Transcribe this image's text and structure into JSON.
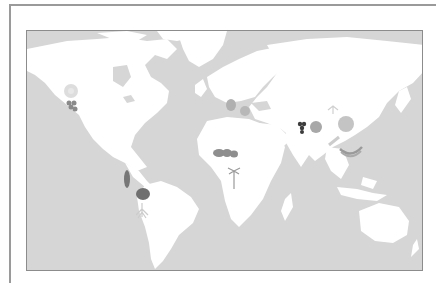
{
  "map": {
    "title": "",
    "ocean_color": "#d6d6d6",
    "land_color": "#ffffff",
    "frame_color": "#8c8c8c"
  },
  "markers": [
    {
      "name": "citrus-flower",
      "region": "North America (west)",
      "icon": "flower-icon",
      "color": "#d8d8d8"
    },
    {
      "name": "grapes-north-america",
      "region": "North America (west)",
      "icon": "grapes-icon",
      "color": "#8a8a8a"
    },
    {
      "name": "pepper",
      "region": "South America (Andes)",
      "icon": "pepper-icon",
      "color": "#777777"
    },
    {
      "name": "tomato",
      "region": "South America (Brazil)",
      "icon": "tomato-icon",
      "color": "#6f6f6f"
    },
    {
      "name": "plant-roots",
      "region": "South America (south)",
      "icon": "plant-icon",
      "color": "#cfcfcf"
    },
    {
      "name": "olive-pear",
      "region": "Mediterranean",
      "icon": "pear-icon",
      "color": "#b0b0b0"
    },
    {
      "name": "fig",
      "region": "Mediterranean (east)",
      "icon": "fig-icon",
      "color": "#b8b8b8"
    },
    {
      "name": "coffee-beans",
      "region": "West Africa",
      "icon": "beans-icon",
      "color": "#8e8e8e"
    },
    {
      "name": "date-palm",
      "region": "Central Africa",
      "icon": "palm-icon",
      "color": "#9a9a9a"
    },
    {
      "name": "grapes-asia",
      "region": "Central Asia",
      "icon": "grapes-icon",
      "color": "#3c3c3c"
    },
    {
      "name": "apple",
      "region": "Central Asia",
      "icon": "apple-icon",
      "color": "#a8a8a8"
    },
    {
      "name": "orange",
      "region": "China",
      "icon": "orange-icon",
      "color": "#c4c4c4"
    },
    {
      "name": "tea-leaves",
      "region": "China (west)",
      "icon": "leaf-icon",
      "color": "#d4d4d4"
    },
    {
      "name": "sugarcane",
      "region": "Southeast Asia",
      "icon": "cane-icon",
      "color": "#cfcfcf"
    },
    {
      "name": "banana",
      "region": "Southeast Asia",
      "icon": "banana-icon",
      "color": "#9a9a9a"
    }
  ]
}
